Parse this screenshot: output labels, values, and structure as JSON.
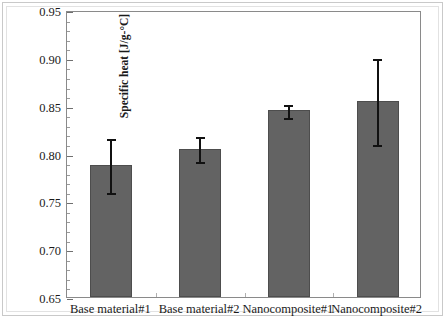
{
  "chart_data": {
    "type": "bar",
    "title": "",
    "xlabel": "",
    "ylabel": "Specific heat [J/g-°C]",
    "ylim": [
      0.65,
      0.95
    ],
    "ytick_step": 0.05,
    "yticks": [
      "0.65",
      "0.70",
      "0.75",
      "0.80",
      "0.85",
      "0.90",
      "0.95"
    ],
    "ytick_values": [
      0.65,
      0.7,
      0.75,
      0.8,
      0.85,
      0.9,
      0.95
    ],
    "minor_ticks_per_interval": 5,
    "grid": false,
    "legend": null,
    "bar_color": "#636363",
    "error_bar_color": "#111111",
    "categories": [
      "Base material#1",
      "Base material#2",
      "Nanocomposite#1",
      "Nanocomposite#2"
    ],
    "values": [
      0.788,
      0.805,
      0.845,
      0.855
    ],
    "errors": [
      0.029,
      0.014,
      0.008,
      0.046
    ],
    "series": [
      {
        "name": "Specific heat",
        "values": [
          0.788,
          0.805,
          0.845,
          0.855
        ],
        "errors": [
          0.029,
          0.014,
          0.008,
          0.046
        ]
      }
    ]
  },
  "figure": {
    "caption": ""
  }
}
